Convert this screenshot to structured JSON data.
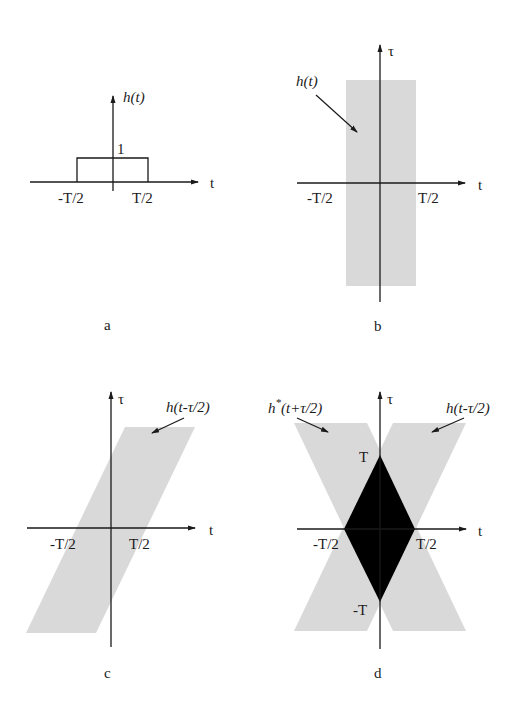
{
  "colors": {
    "shade": "#d9d9d9",
    "overlap": "#000000",
    "ink": "#1a1a1a",
    "background": "#ffffff"
  },
  "panels": [
    {
      "id": "a",
      "caption": "a",
      "function_label": "h(t)",
      "t_axis_label": "t",
      "height_label": "1",
      "tick_labels": [
        "-T/2",
        "T/2"
      ],
      "description": "rectangular pulse of height 1 from -T/2 to T/2"
    },
    {
      "id": "b",
      "caption": "b",
      "region_label": "h(t)",
      "t_axis_label": "t",
      "tau_axis_label": "τ",
      "tick_labels": [
        "-T/2",
        "T/2"
      ],
      "description": "vertical shaded strip |t| < T/2 in the (t, τ) plane"
    },
    {
      "id": "c",
      "caption": "c",
      "region_label": "h(t-τ/2)",
      "t_axis_label": "t",
      "tau_axis_label": "τ",
      "tick_labels": [
        "-T/2",
        "T/2"
      ],
      "description": "sheared shaded strip |t - τ/2| < T/2"
    },
    {
      "id": "d",
      "caption": "d",
      "region_label_left_base": "h",
      "region_label_left_sup": "*",
      "region_label_left_arg": "(t+τ/2)",
      "region_label_right": "h(t-τ/2)",
      "t_axis_label": "t",
      "tau_axis_label": "τ",
      "tick_labels": [
        "-T/2",
        "T/2"
      ],
      "tau_tick_labels": [
        "T",
        "-T"
      ],
      "description": "two crossing strips; overlap diamond with vertices (0,T), (±T/2,0), (0,-T) filled black"
    }
  ]
}
